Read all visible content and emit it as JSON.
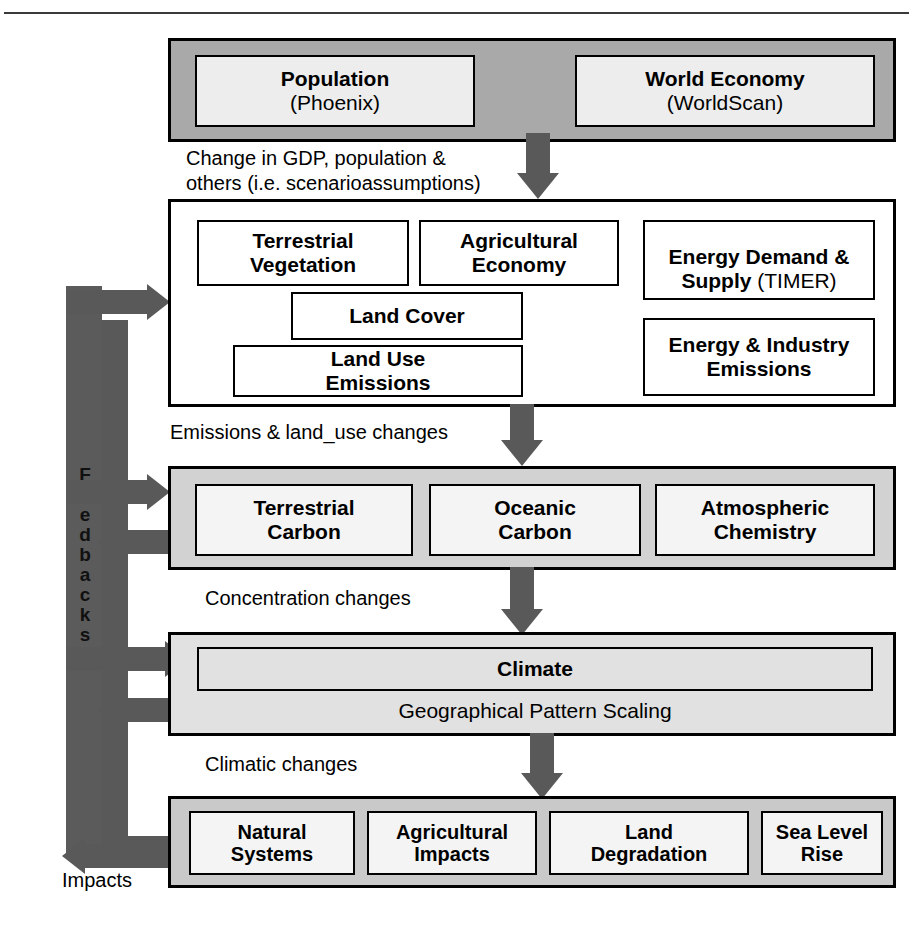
{
  "figure": {
    "page_number_fragment": ""
  },
  "blocks": {
    "drivers": {
      "name": "drivers-block",
      "items": [
        {
          "title": "Population",
          "sub": "(Phoenix)"
        },
        {
          "title": "World Economy",
          "sub": "(WorldScan)"
        }
      ]
    },
    "image_model": {
      "name": "image-model-block",
      "items": [
        {
          "title": "Terrestrial\nVegetation",
          "sub": ""
        },
        {
          "title": "Agricultural\nEconomy",
          "sub": ""
        },
        {
          "title": "Energy Demand &\nSupply ",
          "sub": "(TIMER)"
        },
        {
          "title": "Land Cover",
          "sub": ""
        },
        {
          "title": "Land Use\nEmissions",
          "sub": ""
        },
        {
          "title": "Energy & Industry\nEmissions",
          "sub": ""
        }
      ]
    },
    "carbon_cycle": {
      "name": "carbon-cycle-block",
      "items": [
        {
          "title": "Terrestrial\nCarbon"
        },
        {
          "title": "Oceanic\nCarbon"
        },
        {
          "title": "Atmospheric\nChemistry"
        }
      ]
    },
    "climate": {
      "name": "climate-block",
      "title": "Climate",
      "subtitle": "Geographical Pattern Scaling"
    },
    "impacts": {
      "name": "impacts-block",
      "items": [
        {
          "title": "Natural\nSystems"
        },
        {
          "title": "Agricultural\nImpacts"
        },
        {
          "title": "Land\nDegradation"
        },
        {
          "title": "Sea Level\nRise"
        }
      ]
    }
  },
  "flow_labels": {
    "drivers_to_image": "Change in GDP, population &\nothers (i.e. scenarioassumptions)",
    "image_to_carbon": "Emissions & land_use changes",
    "carbon_to_climate": "Concentration changes",
    "climate_to_impacts": "Climatic changes",
    "impacts_to_feedback": "Impacts"
  },
  "feedback": {
    "label": "Feedbacks",
    "letters": [
      "F",
      "e",
      "e",
      "d",
      "b",
      "a",
      "c",
      "k",
      "s"
    ]
  },
  "colors": {
    "arrow": "#595959",
    "spine": "#5b5b5b",
    "block_dark": "#a9a9a9",
    "block_mid": "#d2d2d2",
    "block_light": "#e1e1e1",
    "block_impacts": "#c9c9c9",
    "outline": "#000000",
    "page_bg": "#ffffff"
  }
}
